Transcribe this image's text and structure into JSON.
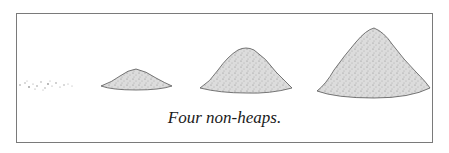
{
  "figure": {
    "caption": "Four non-heaps.",
    "piles": [
      {
        "name": "scattered-grains",
        "size": "none"
      },
      {
        "name": "small-pile",
        "size": "small"
      },
      {
        "name": "medium-pile",
        "size": "medium"
      },
      {
        "name": "large-pile",
        "size": "large"
      }
    ],
    "colors": {
      "frame": "#7a7a7a",
      "pile_fill": "#d8d8d8",
      "pile_edge": "#555555"
    }
  }
}
